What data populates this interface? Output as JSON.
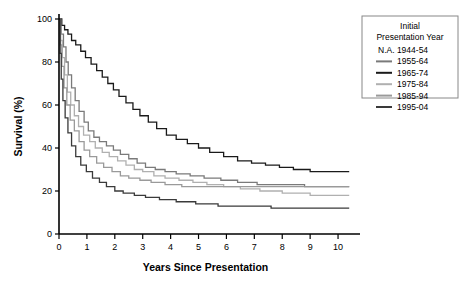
{
  "chart_data": {
    "type": "line",
    "title": "",
    "xlabel": "Years Since Presentation",
    "ylabel": "Survival (%)",
    "xlim": [
      0,
      10.5
    ],
    "ylim": [
      0,
      100
    ],
    "xticks": [
      "0",
      "1",
      "2",
      "3",
      "4",
      "5",
      "6",
      "7",
      "8",
      "9",
      "10"
    ],
    "yticks": [
      "0",
      "20",
      "40",
      "60",
      "80",
      "100"
    ],
    "grid": false,
    "legend_position": "top-right",
    "legend_title_line1": "Initial",
    "legend_title_line2": "Presentation Year",
    "series": [
      {
        "name": "N.A. 1944-54",
        "color": "#ffffff",
        "swatch": false,
        "final_value": null,
        "points": []
      },
      {
        "name": "1955-64",
        "color": "#7a7a7a",
        "swatch": true,
        "final_value": 22,
        "points": [
          [
            0,
            100
          ],
          [
            0.08,
            93
          ],
          [
            0.16,
            87
          ],
          [
            0.25,
            80
          ],
          [
            0.33,
            74
          ],
          [
            0.45,
            68
          ],
          [
            0.58,
            62
          ],
          [
            0.72,
            57
          ],
          [
            0.9,
            52
          ],
          [
            1.05,
            48
          ],
          [
            1.25,
            45
          ],
          [
            1.45,
            43
          ],
          [
            1.7,
            41
          ],
          [
            1.95,
            39
          ],
          [
            2.2,
            37
          ],
          [
            2.5,
            35
          ],
          [
            2.8,
            33
          ],
          [
            3.1,
            31
          ],
          [
            3.45,
            30
          ],
          [
            3.8,
            29
          ],
          [
            4.2,
            28
          ],
          [
            4.7,
            27
          ],
          [
            5.2,
            26
          ],
          [
            5.8,
            25
          ],
          [
            6.4,
            24
          ],
          [
            7.1,
            23
          ],
          [
            7.9,
            23
          ],
          [
            8.8,
            22
          ],
          [
            10.4,
            22
          ]
        ]
      },
      {
        "name": "1965-74",
        "color": "#1a1a1a",
        "swatch": true,
        "final_value": 29,
        "points": [
          [
            0,
            100
          ],
          [
            0.1,
            97
          ],
          [
            0.2,
            95
          ],
          [
            0.32,
            93
          ],
          [
            0.45,
            90
          ],
          [
            0.6,
            88
          ],
          [
            0.78,
            85
          ],
          [
            0.95,
            82
          ],
          [
            1.15,
            79
          ],
          [
            1.35,
            76
          ],
          [
            1.55,
            73
          ],
          [
            1.75,
            70
          ],
          [
            1.95,
            67
          ],
          [
            2.15,
            64
          ],
          [
            2.4,
            61
          ],
          [
            2.65,
            58
          ],
          [
            2.9,
            55
          ],
          [
            3.2,
            52
          ],
          [
            3.5,
            49
          ],
          [
            3.85,
            46
          ],
          [
            4.2,
            44
          ],
          [
            4.6,
            42
          ],
          [
            5.0,
            40
          ],
          [
            5.4,
            38
          ],
          [
            5.9,
            36
          ],
          [
            6.4,
            34
          ],
          [
            6.9,
            33
          ],
          [
            7.4,
            32
          ],
          [
            7.9,
            31
          ],
          [
            8.4,
            30
          ],
          [
            9.0,
            29
          ],
          [
            10.4,
            29
          ]
        ]
      },
      {
        "name": "1975-84",
        "color": "#b0b0b0",
        "swatch": true,
        "final_value": 18,
        "points": [
          [
            0,
            100
          ],
          [
            0.06,
            90
          ],
          [
            0.12,
            82
          ],
          [
            0.2,
            74
          ],
          [
            0.3,
            66
          ],
          [
            0.42,
            60
          ],
          [
            0.55,
            55
          ],
          [
            0.7,
            50
          ],
          [
            0.88,
            46
          ],
          [
            1.1,
            43
          ],
          [
            1.3,
            40
          ],
          [
            1.55,
            38
          ],
          [
            1.8,
            36
          ],
          [
            2.1,
            34
          ],
          [
            2.4,
            32
          ],
          [
            2.7,
            30
          ],
          [
            3.0,
            29
          ],
          [
            3.4,
            27
          ],
          [
            3.8,
            26
          ],
          [
            4.3,
            25
          ],
          [
            4.8,
            24
          ],
          [
            5.3,
            23
          ],
          [
            5.9,
            22
          ],
          [
            6.5,
            21
          ],
          [
            7.2,
            20
          ],
          [
            8.0,
            19
          ],
          [
            9.0,
            18
          ],
          [
            10.4,
            18
          ]
        ]
      },
      {
        "name": "1985-94",
        "color": "#9a9a9a",
        "swatch": true,
        "final_value": 22,
        "points": [
          [
            0,
            100
          ],
          [
            0.05,
            88
          ],
          [
            0.1,
            78
          ],
          [
            0.18,
            68
          ],
          [
            0.28,
            60
          ],
          [
            0.4,
            53
          ],
          [
            0.55,
            48
          ],
          [
            0.72,
            43
          ],
          [
            0.9,
            39
          ],
          [
            1.1,
            36
          ],
          [
            1.35,
            33
          ],
          [
            1.6,
            31
          ],
          [
            1.9,
            29
          ],
          [
            2.2,
            27
          ],
          [
            2.5,
            26
          ],
          [
            2.9,
            25
          ],
          [
            3.3,
            24
          ],
          [
            3.8,
            23
          ],
          [
            4.4,
            22
          ],
          [
            5.1,
            22
          ],
          [
            6.0,
            22
          ],
          [
            7.0,
            22
          ],
          [
            8.0,
            22
          ],
          [
            9.0,
            22
          ],
          [
            10.4,
            22
          ]
        ]
      },
      {
        "name": "1995-04",
        "color": "#3a3a3a",
        "swatch": true,
        "final_value": 12,
        "points": [
          [
            0,
            100
          ],
          [
            0.04,
            84
          ],
          [
            0.08,
            72
          ],
          [
            0.14,
            62
          ],
          [
            0.22,
            54
          ],
          [
            0.32,
            47
          ],
          [
            0.45,
            41
          ],
          [
            0.6,
            36
          ],
          [
            0.78,
            32
          ],
          [
            0.98,
            29
          ],
          [
            1.2,
            26
          ],
          [
            1.45,
            24
          ],
          [
            1.7,
            22
          ],
          [
            2.0,
            20
          ],
          [
            2.3,
            19
          ],
          [
            2.7,
            18
          ],
          [
            3.1,
            17
          ],
          [
            3.6,
            16
          ],
          [
            4.2,
            15
          ],
          [
            4.9,
            14
          ],
          [
            5.7,
            13
          ],
          [
            6.6,
            13
          ],
          [
            7.6,
            12
          ],
          [
            8.8,
            12
          ],
          [
            10.4,
            12
          ]
        ]
      }
    ]
  }
}
